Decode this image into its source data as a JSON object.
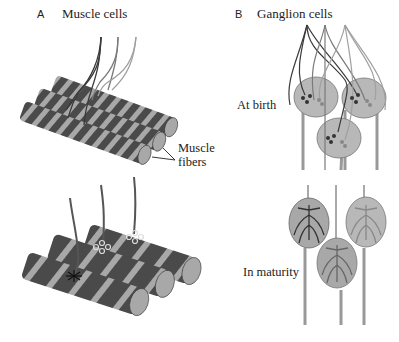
{
  "panel_a": {
    "letter": "A",
    "title": "Muscle cells",
    "label_line1": "Muscle",
    "label_line2": "fibers"
  },
  "panel_b": {
    "letter": "B",
    "title": "Ganglion cells",
    "stage_top": "At birth",
    "stage_bottom": "In maturity"
  },
  "colors": {
    "fiber_dark": "#4a4a4a",
    "fiber_light": "#a8a8a8",
    "cell_fill": "#b8b8b8",
    "axon_dark": "#3a3a3a",
    "axon_mid": "#7a7a7a",
    "axon_light": "#a0a0a0"
  }
}
